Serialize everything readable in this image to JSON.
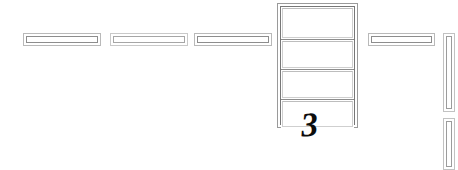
{
  "drawing": {
    "title": "Floor Plan Fragment",
    "background_color": "#ffffff",
    "line_color": "#8d8d8d",
    "line_color_light": "#c2c2c2",
    "ink_color": "#0d0d0d",
    "width": 458,
    "height": 170
  },
  "room_label": {
    "number": "3"
  },
  "horizontal_walls": [
    {
      "id": "wall-segment-1",
      "x": 23,
      "y": 33,
      "w": 78,
      "h": 13,
      "tone": "normal"
    },
    {
      "id": "wall-segment-2",
      "x": 110,
      "y": 33,
      "w": 78,
      "h": 13,
      "tone": "soft"
    },
    {
      "id": "wall-segment-3",
      "x": 194,
      "y": 33,
      "w": 78,
      "h": 13,
      "tone": "normal"
    },
    {
      "id": "wall-segment-4",
      "x": 368,
      "y": 33,
      "w": 67,
      "h": 13,
      "tone": "normal"
    }
  ],
  "room_frame": {
    "id": "room-frame",
    "x": 277,
    "y": 3,
    "w": 81,
    "h": 125,
    "cells": [
      {
        "id": "room-cell-1",
        "h": 33
      },
      {
        "id": "room-cell-2",
        "h": 30
      },
      {
        "id": "room-cell-3",
        "h": 30
      },
      {
        "id": "room-cell-4",
        "h": 28
      }
    ]
  },
  "vertical_walls": [
    {
      "id": "vertical-wall-1",
      "x": 443,
      "y": 33,
      "w": 12,
      "h": 79
    },
    {
      "id": "vertical-wall-2",
      "x": 443,
      "y": 118,
      "w": 12,
      "h": 52
    }
  ],
  "number_position": {
    "x": 301,
    "y": 108
  }
}
